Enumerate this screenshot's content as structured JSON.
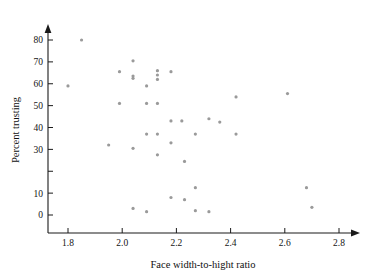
{
  "chart_data": {
    "type": "scatter",
    "title": "",
    "xlabel": "Face width-to-hight ratio",
    "ylabel": "Percent trusting",
    "xlim": [
      1.72,
      2.86
    ],
    "ylim": [
      -6,
      86
    ],
    "grid": false,
    "legend": null,
    "marker": {
      "shape": "circle",
      "color": "#9a9a9a",
      "size_px": 3.2
    },
    "xticks": [
      1.8,
      2.0,
      2.2,
      2.4,
      2.6,
      2.8
    ],
    "xticklabels": [
      "1.8",
      "2.0",
      "2.2",
      "2.4",
      "2.6",
      "2.8"
    ],
    "yticks": [
      0,
      10,
      20,
      30,
      40,
      50,
      60,
      70,
      80
    ],
    "yticklabels": [
      "0",
      "10",
      "",
      "30",
      "40",
      "50",
      "60",
      "70",
      "80"
    ],
    "points": [
      {
        "x": 1.8,
        "y": 59
      },
      {
        "x": 1.85,
        "y": 80
      },
      {
        "x": 1.95,
        "y": 32
      },
      {
        "x": 1.99,
        "y": 65.5
      },
      {
        "x": 1.99,
        "y": 51
      },
      {
        "x": 2.04,
        "y": 70.5
      },
      {
        "x": 2.04,
        "y": 63.5
      },
      {
        "x": 2.04,
        "y": 62.5
      },
      {
        "x": 2.04,
        "y": 30.5
      },
      {
        "x": 2.04,
        "y": 3
      },
      {
        "x": 2.09,
        "y": 59
      },
      {
        "x": 2.09,
        "y": 51
      },
      {
        "x": 2.09,
        "y": 37
      },
      {
        "x": 2.09,
        "y": 1.5
      },
      {
        "x": 2.13,
        "y": 66
      },
      {
        "x": 2.13,
        "y": 64
      },
      {
        "x": 2.13,
        "y": 62
      },
      {
        "x": 2.13,
        "y": 51
      },
      {
        "x": 2.13,
        "y": 37
      },
      {
        "x": 2.13,
        "y": 27.5
      },
      {
        "x": 2.18,
        "y": 65.5
      },
      {
        "x": 2.18,
        "y": 43
      },
      {
        "x": 2.18,
        "y": 33
      },
      {
        "x": 2.18,
        "y": 8
      },
      {
        "x": 2.22,
        "y": 43
      },
      {
        "x": 2.23,
        "y": 24.5
      },
      {
        "x": 2.23,
        "y": 7
      },
      {
        "x": 2.27,
        "y": 37
      },
      {
        "x": 2.27,
        "y": 12.5
      },
      {
        "x": 2.27,
        "y": 2
      },
      {
        "x": 2.32,
        "y": 44
      },
      {
        "x": 2.32,
        "y": 1.5
      },
      {
        "x": 2.36,
        "y": 42.5
      },
      {
        "x": 2.42,
        "y": 54
      },
      {
        "x": 2.42,
        "y": 37
      },
      {
        "x": 2.61,
        "y": 55.5
      },
      {
        "x": 2.68,
        "y": 12.5
      },
      {
        "x": 2.7,
        "y": 3.5
      }
    ]
  }
}
